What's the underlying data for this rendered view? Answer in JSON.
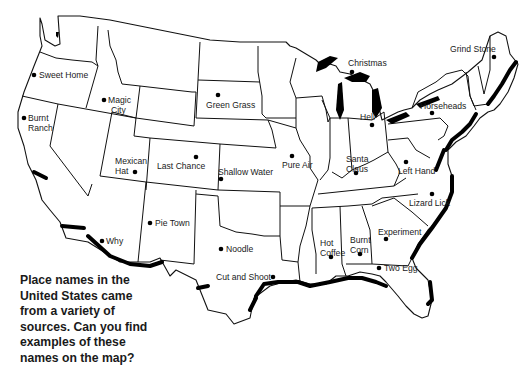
{
  "caption": "Place names in the United States came from a variety of sources. Can you find examples of these names on the map?",
  "colors": {
    "outline": "#111111",
    "coast": "#000000",
    "background": "#ffffff"
  },
  "places": [
    {
      "id": "sweet-home",
      "label": "Sweet Home",
      "dot": [
        34,
        75
      ]
    },
    {
      "id": "burnt-ranch",
      "label": "Burnt\nRanch",
      "dot": [
        24,
        118
      ]
    },
    {
      "id": "magic-city",
      "label": "Magic\nCity",
      "dot": [
        104,
        100
      ]
    },
    {
      "id": "green-grass",
      "label": "Green Grass",
      "dot": [
        218,
        95
      ]
    },
    {
      "id": "christmas",
      "label": "Christmas",
      "dot": [
        352,
        72
      ]
    },
    {
      "id": "grind-stone",
      "label": "Grind Stone",
      "dot": [
        494,
        57
      ]
    },
    {
      "id": "horseheads",
      "label": "Horseheads",
      "dot": [
        432,
        113
      ]
    },
    {
      "id": "hell",
      "label": "Hell",
      "dot": [
        372,
        125
      ]
    },
    {
      "id": "mexican-hat",
      "label": "Mexican\nHat",
      "dot": [
        135,
        172
      ]
    },
    {
      "id": "last-chance",
      "label": "Last Chance",
      "dot": [
        196,
        157
      ]
    },
    {
      "id": "shallow-water",
      "label": "Shallow Water",
      "dot": [
        221,
        179
      ]
    },
    {
      "id": "pure-air",
      "label": "Pure Air",
      "dot": [
        292,
        156
      ]
    },
    {
      "id": "santa-claus",
      "label": "Santa\nClaus",
      "dot": [
        356,
        173
      ]
    },
    {
      "id": "left-hand",
      "label": "Left Hand",
      "dot": [
        406,
        162
      ]
    },
    {
      "id": "lizard-lick",
      "label": "Lizard Lick",
      "dot": [
        432,
        194
      ]
    },
    {
      "id": "pie-town",
      "label": "Pie Town",
      "dot": [
        150,
        223
      ]
    },
    {
      "id": "why",
      "label": "Why",
      "dot": [
        102,
        241
      ]
    },
    {
      "id": "noodle",
      "label": "Noodle",
      "dot": [
        221,
        249
      ]
    },
    {
      "id": "cut-and-shoot",
      "label": "Cut and Shoot",
      "dot": [
        273,
        277
      ]
    },
    {
      "id": "hot-coffee",
      "label": "Hot\nCoffee",
      "dot": [
        331,
        257
      ]
    },
    {
      "id": "burnt-corn",
      "label": "Burnt\nCorn",
      "dot": [
        360,
        254
      ]
    },
    {
      "id": "experiment",
      "label": "Experiment",
      "dot": [
        386,
        239
      ]
    },
    {
      "id": "two-egg",
      "label": "Two Egg",
      "dot": [
        379,
        268
      ]
    }
  ],
  "labels": {
    "sweet_home": "Sweet Home",
    "burnt_ranch_1": "Burnt",
    "burnt_ranch_2": "Ranch",
    "magic_city_1": "Magic",
    "magic_city_2": "City",
    "green_grass": "Green Grass",
    "christmas": "Christmas",
    "grind_stone": "Grind Stone",
    "horseheads": "Horseheads",
    "hell": "Hell",
    "mexican_hat_1": "Mexican",
    "mexican_hat_2": "Hat",
    "last_chance": "Last Chance",
    "shallow_water": "Shallow Water",
    "pure_air": "Pure Air",
    "santa_claus_1": "Santa",
    "santa_claus_2": "Claus",
    "left_hand": "Left Hand",
    "lizard_lick": "Lizard Lick",
    "pie_town": "Pie Town",
    "why": "Why",
    "noodle": "Noodle",
    "cut_and_shoot": "Cut and Shoot",
    "hot_coffee_1": "Hot",
    "hot_coffee_2": "Coffee",
    "burnt_corn_1": "Burnt",
    "burnt_corn_2": "Corn",
    "experiment": "Experiment",
    "two_egg": "Two Egg"
  }
}
